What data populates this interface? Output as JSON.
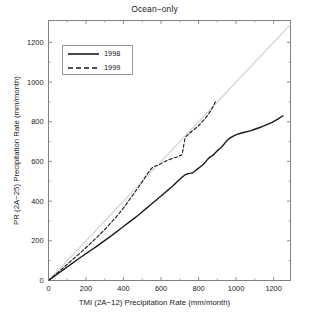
{
  "chart_data": {
    "type": "line",
    "title": "Ocean−only",
    "xlabel": "TMI (2A−12) Precipitation Rate (mm/month)",
    "ylabel": "PR (2A−25) Precipitation Rate (mm/month)",
    "xlim": [
      0,
      1290
    ],
    "ylim": [
      0,
      1310
    ],
    "xticks": [
      0,
      200,
      400,
      600,
      800,
      1000,
      1200
    ],
    "yticks": [
      0,
      200,
      400,
      600,
      800,
      1000,
      1200
    ],
    "xticklabels": [
      "0",
      "200",
      "400",
      "600",
      "800",
      "1000",
      "1200"
    ],
    "yticklabels": [
      "0",
      "200",
      "400",
      "600",
      "800",
      "1000",
      "1200"
    ],
    "grid": false,
    "legend_position": "upper left",
    "frame": true,
    "tick_direction": "in",
    "colors": {
      "series_1998": "#1a1a1a",
      "series_1999": "#1a1a1a",
      "reference_line": "#d8d8d8",
      "axis": "#808080",
      "text": "#1a1a1a"
    },
    "reference_line": {
      "name": "one-to-one",
      "x": [
        0,
        1290
      ],
      "y": [
        0,
        1290
      ],
      "style": "solid",
      "color": "#d8d8d8"
    },
    "series": [
      {
        "name": "1998",
        "style": "solid",
        "color": "#1a1a1a",
        "x": [
          0,
          15,
          35,
          55,
          80,
          105,
          130,
          155,
          180,
          205,
          230,
          255,
          280,
          305,
          330,
          355,
          380,
          405,
          430,
          455,
          480,
          500,
          520,
          540,
          560,
          575,
          590,
          605,
          620,
          635,
          650,
          662,
          675,
          688,
          700,
          712,
          722,
          732,
          742,
          752,
          760,
          768,
          776,
          784,
          792,
          800,
          808,
          816,
          824,
          832,
          840,
          848,
          856,
          864,
          872,
          880,
          888,
          896,
          904,
          912,
          920,
          930,
          940,
          950,
          962,
          975,
          990,
          1005,
          1025,
          1050,
          1075,
          1100,
          1130,
          1160,
          1190,
          1220,
          1250
        ],
        "y": [
          0,
          10,
          24,
          38,
          55,
          72,
          89,
          106,
          122,
          139,
          155,
          171,
          188,
          205,
          222,
          240,
          258,
          276,
          294,
          312,
          330,
          346,
          362,
          378,
          394,
          406,
          418,
          430,
          442,
          454,
          466,
          476,
          488,
          500,
          510,
          520,
          528,
          534,
          538,
          540,
          541,
          543,
          548,
          554,
          560,
          566,
          572,
          578,
          584,
          592,
          600,
          610,
          618,
          624,
          628,
          634,
          642,
          650,
          658,
          664,
          670,
          680,
          692,
          704,
          714,
          722,
          730,
          736,
          742,
          748,
          754,
          762,
          772,
          784,
          796,
          812,
          830
        ]
      },
      {
        "name": "1999",
        "style": "dashed",
        "color": "#1a1a1a",
        "x": [
          0,
          15,
          35,
          55,
          80,
          105,
          130,
          155,
          180,
          205,
          230,
          255,
          280,
          305,
          330,
          355,
          380,
          400,
          420,
          440,
          460,
          475,
          490,
          505,
          520,
          535,
          548,
          558,
          566,
          574,
          582,
          592,
          602,
          612,
          622,
          634,
          646,
          658,
          668,
          678,
          690,
          700,
          710,
          715,
          720,
          724,
          728,
          734,
          742,
          752,
          764,
          778,
          792,
          806,
          820,
          834,
          848,
          862,
          876,
          890
        ],
        "y": [
          0,
          12,
          28,
          45,
          65,
          86,
          107,
          128,
          148,
          170,
          192,
          214,
          238,
          262,
          288,
          314,
          342,
          366,
          392,
          418,
          444,
          464,
          484,
          506,
          528,
          548,
          564,
          572,
          576,
          578,
          580,
          584,
          590,
          596,
          600,
          606,
          610,
          614,
          618,
          620,
          624,
          628,
          632,
          648,
          676,
          700,
          716,
          726,
          734,
          742,
          752,
          762,
          774,
          786,
          800,
          816,
          832,
          852,
          874,
          900
        ]
      }
    ]
  },
  "legend": {
    "entries": [
      {
        "label": "1998",
        "style": "solid"
      },
      {
        "label": "1999",
        "style": "dashed"
      }
    ]
  }
}
